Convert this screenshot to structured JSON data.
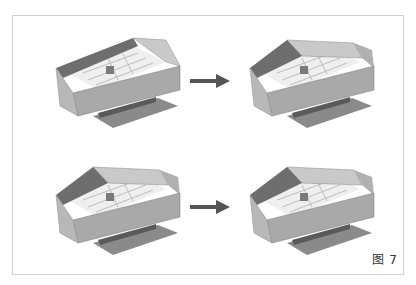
{
  "figure": {
    "caption": "图 7",
    "panels": [
      {
        "id": "top-left",
        "description": "building model, step 1"
      },
      {
        "id": "top-right",
        "description": "building model, step 2"
      },
      {
        "id": "bottom-left",
        "description": "building model, step 3"
      },
      {
        "id": "bottom-right",
        "description": "building model, step 4"
      }
    ],
    "arrows": [
      "arrow-right",
      "arrow-right"
    ],
    "colors": {
      "dark_face": "#6e6e6e",
      "mid_face": "#a9a9a9",
      "light_face": "#c9c9c9",
      "interior": "#efefef",
      "arrow": "#555555",
      "border": "#cfcfcf"
    }
  }
}
